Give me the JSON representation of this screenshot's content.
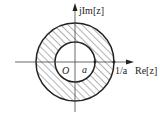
{
  "diagram": {
    "type": "complex-plane-annulus",
    "axes": {
      "vertical_label": "jIm[z]",
      "horizontal_label": "Re[z]"
    },
    "labels": {
      "origin": "O",
      "inner_radius": "a",
      "outer_radius": "1/a"
    },
    "region": {
      "description": "hatched annulus between circle radius a and circle radius 1/a",
      "inner_circle_radius_label": "a",
      "outer_circle_radius_label": "1/a"
    },
    "colors": {
      "stroke": "#222222",
      "hatch": "#555555",
      "background": "#ffffff"
    }
  }
}
